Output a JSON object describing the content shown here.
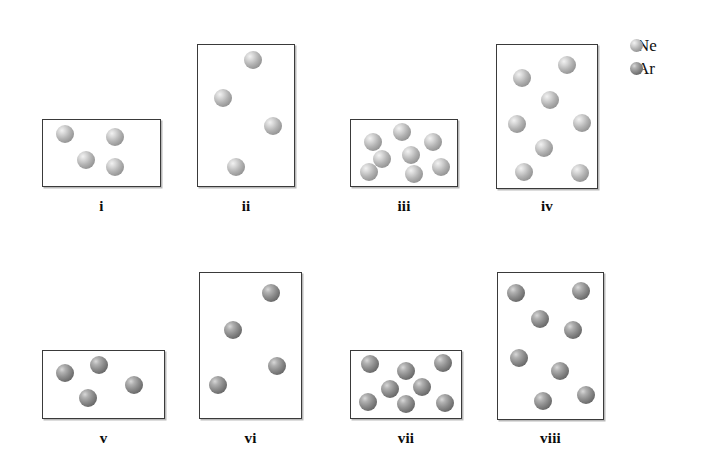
{
  "figure": {
    "background_color": "#ffffff",
    "box_border_color": "#3a3a3a"
  },
  "legend": {
    "name": "gas-legend",
    "entries": [
      {
        "label": "Ne",
        "color": "#b3b3b3",
        "species": "neon"
      },
      {
        "label": "Ar",
        "color": "#8e8e8e",
        "species": "argon"
      }
    ]
  },
  "containers": [
    {
      "label": "i",
      "gas": "Ne",
      "particle_count": 4,
      "box": {
        "x": 42,
        "y": 119,
        "width": 119,
        "height": 68
      },
      "label_y": 198,
      "particles": [
        {
          "x": 22,
          "y": 14,
          "r": 9
        },
        {
          "x": 72,
          "y": 17,
          "r": 9
        },
        {
          "x": 43,
          "y": 40,
          "r": 9
        },
        {
          "x": 72,
          "y": 47,
          "r": 9
        }
      ]
    },
    {
      "label": "ii",
      "gas": "Ne",
      "particle_count": 4,
      "box": {
        "x": 197,
        "y": 44,
        "width": 98,
        "height": 143
      },
      "label_y": 198,
      "particles": [
        {
          "x": 55,
          "y": 15,
          "r": 9
        },
        {
          "x": 25,
          "y": 53,
          "r": 9
        },
        {
          "x": 75,
          "y": 81,
          "r": 9
        },
        {
          "x": 38,
          "y": 122,
          "r": 9
        }
      ]
    },
    {
      "label": "iii",
      "gas": "Ne",
      "particle_count": 8,
      "box": {
        "x": 350,
        "y": 119,
        "width": 108,
        "height": 68
      },
      "label_y": 198,
      "particles": [
        {
          "x": 22,
          "y": 22,
          "r": 9
        },
        {
          "x": 51,
          "y": 12,
          "r": 9
        },
        {
          "x": 82,
          "y": 22,
          "r": 9
        },
        {
          "x": 31,
          "y": 39,
          "r": 9
        },
        {
          "x": 60,
          "y": 35,
          "r": 9
        },
        {
          "x": 90,
          "y": 47,
          "r": 9
        },
        {
          "x": 18,
          "y": 52,
          "r": 9
        },
        {
          "x": 63,
          "y": 54,
          "r": 9
        }
      ]
    },
    {
      "label": "iv",
      "gas": "Ne",
      "particle_count": 8,
      "box": {
        "x": 496,
        "y": 44,
        "width": 102,
        "height": 145
      },
      "label_y": 198,
      "particles": [
        {
          "x": 25,
          "y": 33,
          "r": 9
        },
        {
          "x": 70,
          "y": 20,
          "r": 9
        },
        {
          "x": 53,
          "y": 55,
          "r": 9
        },
        {
          "x": 20,
          "y": 79,
          "r": 9
        },
        {
          "x": 85,
          "y": 78,
          "r": 9
        },
        {
          "x": 47,
          "y": 103,
          "r": 9
        },
        {
          "x": 27,
          "y": 127,
          "r": 9
        },
        {
          "x": 83,
          "y": 128,
          "r": 9
        }
      ]
    },
    {
      "label": "v",
      "gas": "Ar",
      "particle_count": 4,
      "box": {
        "x": 42,
        "y": 350,
        "width": 123,
        "height": 69
      },
      "label_y": 430,
      "particles": [
        {
          "x": 22,
          "y": 22,
          "r": 9
        },
        {
          "x": 56,
          "y": 14,
          "r": 9
        },
        {
          "x": 91,
          "y": 34,
          "r": 9
        },
        {
          "x": 45,
          "y": 47,
          "r": 9
        }
      ]
    },
    {
      "label": "vi",
      "gas": "Ar",
      "particle_count": 4,
      "box": {
        "x": 199,
        "y": 272,
        "width": 103,
        "height": 147
      },
      "label_y": 430,
      "particles": [
        {
          "x": 71,
          "y": 20,
          "r": 9
        },
        {
          "x": 33,
          "y": 57,
          "r": 9
        },
        {
          "x": 77,
          "y": 93,
          "r": 9
        },
        {
          "x": 18,
          "y": 112,
          "r": 9
        }
      ]
    },
    {
      "label": "vii",
      "gas": "Ar",
      "particle_count": 8,
      "box": {
        "x": 350,
        "y": 350,
        "width": 112,
        "height": 69
      },
      "label_y": 430,
      "particles": [
        {
          "x": 19,
          "y": 13,
          "r": 9
        },
        {
          "x": 55,
          "y": 20,
          "r": 9
        },
        {
          "x": 92,
          "y": 12,
          "r": 9
        },
        {
          "x": 39,
          "y": 38,
          "r": 9
        },
        {
          "x": 71,
          "y": 36,
          "r": 9
        },
        {
          "x": 17,
          "y": 51,
          "r": 9
        },
        {
          "x": 55,
          "y": 53,
          "r": 9
        },
        {
          "x": 94,
          "y": 52,
          "r": 9
        }
      ]
    },
    {
      "label": "viii",
      "gas": "Ar",
      "particle_count": 8,
      "box": {
        "x": 497,
        "y": 272,
        "width": 107,
        "height": 148
      },
      "label_y": 430,
      "particles": [
        {
          "x": 18,
          "y": 20,
          "r": 9
        },
        {
          "x": 83,
          "y": 18,
          "r": 9
        },
        {
          "x": 42,
          "y": 46,
          "r": 9
        },
        {
          "x": 75,
          "y": 57,
          "r": 9
        },
        {
          "x": 21,
          "y": 85,
          "r": 9
        },
        {
          "x": 62,
          "y": 98,
          "r": 9
        },
        {
          "x": 45,
          "y": 128,
          "r": 9
        },
        {
          "x": 88,
          "y": 122,
          "r": 9
        }
      ]
    }
  ]
}
